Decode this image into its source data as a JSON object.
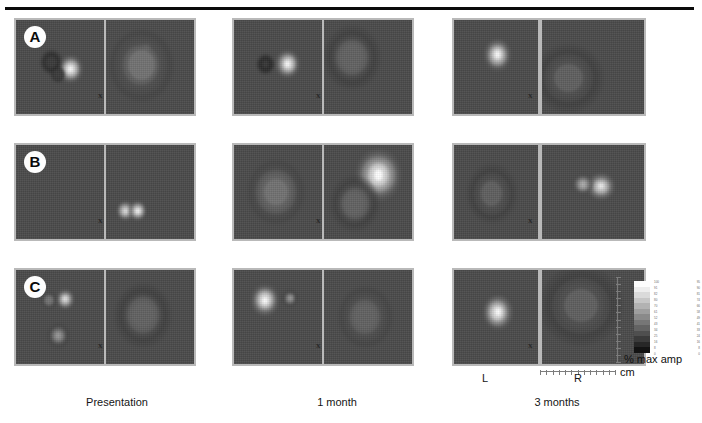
{
  "figure": {
    "type": "thermographic-contour-panel-grid",
    "rows": 3,
    "columns": 6,
    "top_rule": true
  },
  "row_badges": [
    {
      "label": "A"
    },
    {
      "label": "B"
    },
    {
      "label": "C"
    }
  ],
  "separators": [
    {
      "label": "x"
    },
    {
      "label": "x"
    },
    {
      "label": "x"
    },
    {
      "label": "x"
    },
    {
      "label": "x"
    },
    {
      "label": "x"
    },
    {
      "label": "x"
    },
    {
      "label": "x"
    },
    {
      "label": "x"
    }
  ],
  "column_captions": [
    {
      "label": "Presentation"
    },
    {
      "label": "1 month"
    },
    {
      "label": "3 months"
    }
  ],
  "side_labels": [
    {
      "label": "L"
    },
    {
      "label": "R"
    }
  ],
  "colorbar": {
    "title": "% max amp",
    "orientation": "vertical",
    "high_end": "top",
    "tick_rows": [
      {
        "left": "100",
        "right": "95"
      },
      {
        "left": "91",
        "right": "90"
      },
      {
        "left": "82",
        "right": "81"
      },
      {
        "left": "80",
        "right": "74"
      },
      {
        "left": "70",
        "right": "66"
      },
      {
        "left": "61",
        "right": "58"
      },
      {
        "left": "52",
        "right": "49"
      },
      {
        "left": "43",
        "right": "41"
      },
      {
        "left": "34",
        "right": "33"
      },
      {
        "left": "25",
        "right": "24"
      },
      {
        "left": "16",
        "right": "16"
      },
      {
        "left": "8",
        "right": "8"
      },
      {
        "left": "0",
        "right": "0"
      }
    ],
    "swatches": [
      "#fdfdfd",
      "#ededed",
      "#dadada",
      "#c6c6c6",
      "#b2b2b2",
      "#9e9e9e",
      "#8a8a8a",
      "#767676",
      "#636363",
      "#4f4f4f",
      "#3b3b3b",
      "#272727",
      "#131313"
    ]
  },
  "scale": {
    "unit_label": "cm",
    "vertical_ticks": 13,
    "horizontal_ticks": 13
  },
  "chart_data": {
    "type": "heatmap",
    "title": "",
    "xlabel": "",
    "ylabel": "",
    "colorbar_label": "% max amp",
    "scale_unit": "cm",
    "row_labels": [
      "A",
      "B",
      "C"
    ],
    "column_labels": [
      "Presentation",
      "1 month",
      "3 months"
    ],
    "laterality_labels": [
      "L",
      "R"
    ],
    "panels": [
      {
        "row": "A",
        "timepoint": "Presentation",
        "side": "L",
        "description": "large multi-ring contour mass, left-of-center, bright focal hotspot at right edge of mass",
        "peak_percent_max_amp": 100,
        "hotspots": [
          {
            "cx_pct": 62,
            "cy_pct": 52,
            "r_pct": 7,
            "level": 100
          },
          {
            "cx_pct": 40,
            "cy_pct": 45,
            "r_pct": 6,
            "level": 20
          },
          {
            "cx_pct": 48,
            "cy_pct": 58,
            "r_pct": 4,
            "level": 25
          }
        ]
      },
      {
        "row": "A",
        "timepoint": "Presentation",
        "side": "R",
        "description": "broad diffuse mid-gray region, one small bright pinpoint",
        "peak_percent_max_amp": 70,
        "hotspots": [
          {
            "cx_pct": 46,
            "cy_pct": 30,
            "r_pct": 3,
            "level": 85
          },
          {
            "cx_pct": 40,
            "cy_pct": 48,
            "r_pct": 18,
            "level": 48
          }
        ]
      },
      {
        "row": "A",
        "timepoint": "1 month",
        "side": "L",
        "description": "two-lobed contour ring with bright focus on the right lobe",
        "peak_percent_max_amp": 100,
        "hotspots": [
          {
            "cx_pct": 61,
            "cy_pct": 47,
            "r_pct": 7,
            "level": 100
          },
          {
            "cx_pct": 36,
            "cy_pct": 47,
            "r_pct": 5,
            "level": 18
          }
        ]
      },
      {
        "row": "A",
        "timepoint": "1 month",
        "side": "R",
        "description": "soft diffuse blob upper-left with a single bright pinpoint",
        "peak_percent_max_amp": 75,
        "hotspots": [
          {
            "cx_pct": 33,
            "cy_pct": 48,
            "r_pct": 3,
            "level": 90
          },
          {
            "cx_pct": 32,
            "cy_pct": 40,
            "r_pct": 16,
            "level": 45
          }
        ]
      },
      {
        "row": "A",
        "timepoint": "3 months",
        "side": "L",
        "description": "concentric rings around a bright central core, upper-middle",
        "peak_percent_max_amp": 100,
        "hotspots": [
          {
            "cx_pct": 52,
            "cy_pct": 37,
            "r_pct": 8,
            "level": 100
          }
        ]
      },
      {
        "row": "A",
        "timepoint": "3 months",
        "side": "R",
        "description": "low diffuse gray region lower-left, no bright focus",
        "peak_percent_max_amp": 40,
        "hotspots": [
          {
            "cx_pct": 26,
            "cy_pct": 62,
            "r_pct": 17,
            "level": 38
          }
        ]
      },
      {
        "row": "B",
        "timepoint": "Presentation",
        "side": "L",
        "description": "uniform background, no detectable signal",
        "peak_percent_max_amp": 0,
        "hotspots": []
      },
      {
        "row": "B",
        "timepoint": "Presentation",
        "side": "R",
        "description": "two small tight rings with bright centers at lower-left",
        "peak_percent_max_amp": 100,
        "hotspots": [
          {
            "cx_pct": 22,
            "cy_pct": 70,
            "r_pct": 5,
            "level": 95
          },
          {
            "cx_pct": 36,
            "cy_pct": 70,
            "r_pct": 5,
            "level": 100
          }
        ]
      },
      {
        "row": "B",
        "timepoint": "1 month",
        "side": "L",
        "description": "single elongated diffuse mid-gray mass near center",
        "peak_percent_max_amp": 55,
        "hotspots": [
          {
            "cx_pct": 48,
            "cy_pct": 50,
            "r_pct": 16,
            "level": 52
          }
        ]
      },
      {
        "row": "B",
        "timepoint": "1 month",
        "side": "R",
        "description": "large bright irregular mass upper-right with surrounding contour bands",
        "peak_percent_max_amp": 100,
        "hotspots": [
          {
            "cx_pct": 62,
            "cy_pct": 32,
            "r_pct": 13,
            "level": 100
          },
          {
            "cx_pct": 35,
            "cy_pct": 62,
            "r_pct": 14,
            "level": 45
          }
        ]
      },
      {
        "row": "B",
        "timepoint": "3 months",
        "side": "L",
        "description": "faint diffuse gray region center-left",
        "peak_percent_max_amp": 45,
        "hotspots": [
          {
            "cx_pct": 45,
            "cy_pct": 52,
            "r_pct": 15,
            "level": 42
          }
        ]
      },
      {
        "row": "B",
        "timepoint": "3 months",
        "side": "R",
        "description": "broad banded field with two bright foci center-right",
        "peak_percent_max_amp": 95,
        "hotspots": [
          {
            "cx_pct": 58,
            "cy_pct": 44,
            "r_pct": 7,
            "level": 92
          },
          {
            "cx_pct": 40,
            "cy_pct": 42,
            "r_pct": 5,
            "level": 70
          }
        ]
      },
      {
        "row": "C",
        "timepoint": "Presentation",
        "side": "L",
        "description": "three discrete ringed foci: two small round upper, one elongated lower",
        "peak_percent_max_amp": 95,
        "hotspots": [
          {
            "cx_pct": 38,
            "cy_pct": 32,
            "r_pct": 4,
            "level": 55
          },
          {
            "cx_pct": 56,
            "cy_pct": 31,
            "r_pct": 5,
            "level": 92
          },
          {
            "cx_pct": 48,
            "cy_pct": 70,
            "r_pct": 6,
            "level": 60
          }
        ]
      },
      {
        "row": "C",
        "timepoint": "Presentation",
        "side": "R",
        "description": "single soft diffuse oval mass center-left",
        "peak_percent_max_amp": 45,
        "hotspots": [
          {
            "cx_pct": 42,
            "cy_pct": 48,
            "r_pct": 16,
            "level": 44
          }
        ]
      },
      {
        "row": "C",
        "timepoint": "1 month",
        "side": "L",
        "description": "bright vertically elongated core upper-left plus small secondary focus",
        "peak_percent_max_amp": 100,
        "hotspots": [
          {
            "cx_pct": 35,
            "cy_pct": 32,
            "r_pct": 8,
            "level": 100
          },
          {
            "cx_pct": 64,
            "cy_pct": 30,
            "r_pct": 4,
            "level": 60
          }
        ]
      },
      {
        "row": "C",
        "timepoint": "1 month",
        "side": "R",
        "description": "diffuse oval gray mass center",
        "peak_percent_max_amp": 48,
        "hotspots": [
          {
            "cx_pct": 47,
            "cy_pct": 50,
            "r_pct": 15,
            "level": 46
          }
        ]
      },
      {
        "row": "C",
        "timepoint": "3 months",
        "side": "L",
        "description": "bright core with multiple concentric rings, center of panel",
        "peak_percent_max_amp": 100,
        "hotspots": [
          {
            "cx_pct": 52,
            "cy_pct": 45,
            "r_pct": 9,
            "level": 100
          }
        ]
      },
      {
        "row": "C",
        "timepoint": "3 months",
        "side": "R",
        "description": "broad low-level diffuse field spanning upper half",
        "peak_percent_max_amp": 42,
        "hotspots": [
          {
            "cx_pct": 38,
            "cy_pct": 38,
            "r_pct": 20,
            "level": 40
          }
        ]
      }
    ]
  }
}
